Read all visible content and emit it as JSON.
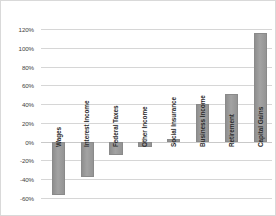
{
  "chart_data": {
    "type": "bar",
    "title": "",
    "subtitle": "",
    "xlabel": "",
    "ylabel": "",
    "categories": [
      "Wages",
      "Interest Income",
      "Federal Taxes",
      "Other Income",
      "Social Insurance",
      "Business Income",
      "Retirement",
      "Capital Gains"
    ],
    "values": [
      -57,
      -38,
      -14,
      -6,
      3,
      40,
      51,
      116
    ],
    "value_unit": "percent",
    "ylim": [
      -60,
      120
    ],
    "ytick_step": 20,
    "ytick_labels": [
      "120%",
      "100%",
      "80%",
      "60%",
      "40%",
      "20%",
      "0%",
      "-20%",
      "-40%",
      "-60%"
    ],
    "ytick_values": [
      120,
      100,
      80,
      60,
      40,
      20,
      0,
      -20,
      -40,
      -60
    ],
    "grid": true,
    "grid_axis": "y",
    "legend": false,
    "legend_position": "none",
    "bar_color": "#9a9a9a",
    "bar_edge_color": "#8a8a8a",
    "grid_color": "#d6d6d6",
    "zero_line_color": "#c9c9c9",
    "border_color": "#d9d9d9",
    "background_color": "#ffffff",
    "label_orientation": "vertical",
    "label_anchor": "zero-baseline"
  }
}
